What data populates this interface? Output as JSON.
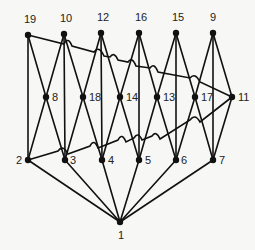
{
  "diagram": {
    "title": "",
    "background": "#f7f7f5",
    "line_color": "#111111",
    "nodes": [
      {
        "id": "19",
        "x": 28,
        "y": 35,
        "label_dx": -4,
        "label_dy": -12
      },
      {
        "id": "10",
        "x": 64,
        "y": 34,
        "label_dx": -4,
        "label_dy": -12
      },
      {
        "id": "12",
        "x": 101,
        "y": 33,
        "label_dx": -4,
        "label_dy": -12
      },
      {
        "id": "16",
        "x": 139,
        "y": 33,
        "label_dx": -4,
        "label_dy": -12
      },
      {
        "id": "15",
        "x": 176,
        "y": 33,
        "label_dx": -4,
        "label_dy": -12
      },
      {
        "id": "9",
        "x": 213,
        "y": 33,
        "label_dx": -3,
        "label_dy": -12
      },
      {
        "id": "8",
        "x": 46,
        "y": 97,
        "label_dx": 6,
        "label_dy": 4
      },
      {
        "id": "18",
        "x": 83,
        "y": 97,
        "label_dx": 6,
        "label_dy": 4
      },
      {
        "id": "14",
        "x": 120,
        "y": 97,
        "label_dx": 6,
        "label_dy": 4
      },
      {
        "id": "13",
        "x": 157,
        "y": 97,
        "label_dx": 6,
        "label_dy": 4
      },
      {
        "id": "17",
        "x": 195,
        "y": 97,
        "label_dx": 6,
        "label_dy": 4
      },
      {
        "id": "11",
        "x": 232,
        "y": 97,
        "label_dx": 6,
        "label_dy": 4
      },
      {
        "id": "2",
        "x": 28,
        "y": 160,
        "label_dx": -12,
        "label_dy": 4
      },
      {
        "id": "3",
        "x": 65,
        "y": 160,
        "label_dx": 5,
        "label_dy": 4
      },
      {
        "id": "4",
        "x": 102,
        "y": 160,
        "label_dx": 6,
        "label_dy": 4
      },
      {
        "id": "5",
        "x": 139,
        "y": 160,
        "label_dx": 6,
        "label_dy": 4
      },
      {
        "id": "6",
        "x": 176,
        "y": 160,
        "label_dx": 5,
        "label_dy": 4
      },
      {
        "id": "7",
        "x": 213,
        "y": 160,
        "label_dx": 6,
        "label_dy": 4
      },
      {
        "id": "1",
        "x": 120,
        "y": 222,
        "label_dx": -2,
        "label_dy": 17
      }
    ],
    "edges": [
      [
        "19",
        "8"
      ],
      [
        "10",
        "8"
      ],
      [
        "10",
        "18"
      ],
      [
        "12",
        "18"
      ],
      [
        "12",
        "14"
      ],
      [
        "16",
        "14"
      ],
      [
        "16",
        "13"
      ],
      [
        "15",
        "13"
      ],
      [
        "15",
        "17"
      ],
      [
        "9",
        "17"
      ],
      [
        "9",
        "11"
      ],
      [
        "19",
        "2"
      ],
      [
        "10",
        "3"
      ],
      [
        "12",
        "4"
      ],
      [
        "16",
        "5"
      ],
      [
        "15",
        "6"
      ],
      [
        "9",
        "7"
      ],
      [
        "8",
        "2"
      ],
      [
        "8",
        "3"
      ],
      [
        "18",
        "3"
      ],
      [
        "18",
        "4"
      ],
      [
        "14",
        "4"
      ],
      [
        "14",
        "5"
      ],
      [
        "13",
        "5"
      ],
      [
        "13",
        "6"
      ],
      [
        "17",
        "6"
      ],
      [
        "17",
        "7"
      ],
      [
        "11",
        "7"
      ],
      [
        "2",
        "1"
      ],
      [
        "3",
        "1"
      ],
      [
        "4",
        "1"
      ],
      [
        "5",
        "1"
      ],
      [
        "6",
        "1"
      ],
      [
        "7",
        "1"
      ]
    ],
    "curved_edges": [
      {
        "from": "19",
        "to": "11",
        "path": "M28,35 L64,44 Q68,36 72,46 L94,52 Q99,45 104,56 L110,57 Q114,51 118,60 L128,62 Q132,56 136,66 L150,68 Q154,62 158,72 L190,78 Q195,72 200,82 L232,97"
      },
      {
        "from": "2",
        "to": "11",
        "path": "M28,160 L58,151 Q63,144 68,154 L90,146 Q94,138 98,148 L118,140 Q122,132 126,142 L134,138 Q138,131 142,140 L152,136 Q156,130 160,139 L190,120 Q195,113 200,122 L232,97"
      }
    ]
  }
}
